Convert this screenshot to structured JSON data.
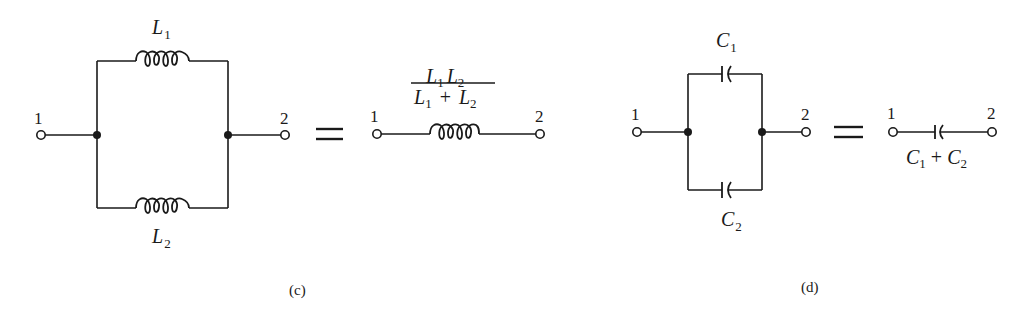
{
  "figure_c": {
    "caption": "(c)",
    "terminal_left": "1",
    "terminal_right": "2",
    "inductor_top": {
      "symbol": "L",
      "subscript": "1"
    },
    "inductor_bottom": {
      "symbol": "L",
      "subscript": "2"
    },
    "equals": "=",
    "equivalent": {
      "terminal_left": "1",
      "terminal_right": "2",
      "numerator": {
        "a_sym": "L",
        "a_sub": "1",
        "b_sym": "L",
        "b_sub": "2"
      },
      "denominator": {
        "a_sym": "L",
        "a_sub": "1",
        "op": "+",
        "b_sym": "L",
        "b_sub": "2"
      },
      "formula_text": "L1 L2 / (L1 + L2)"
    }
  },
  "figure_d": {
    "caption": "(d)",
    "terminal_left": "1",
    "terminal_right": "2",
    "capacitor_top": {
      "symbol": "C",
      "subscript": "1"
    },
    "capacitor_bottom": {
      "symbol": "C",
      "subscript": "2"
    },
    "equals": "=",
    "equivalent": {
      "terminal_left": "1",
      "terminal_right": "2",
      "label": {
        "a_sym": "C",
        "a_sub": "1",
        "op": "+",
        "b_sym": "C",
        "b_sub": "2"
      },
      "formula_text": "C1 + C2"
    }
  }
}
